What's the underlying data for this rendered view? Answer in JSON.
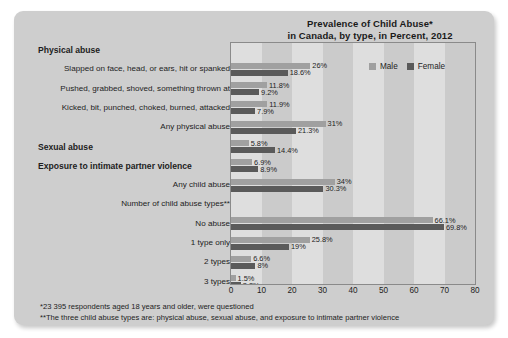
{
  "chart_data": {
    "type": "bar",
    "orientation": "horizontal",
    "title": "Prevalence of Child Abuse*\nin Canada, by type, in Percent, 2012",
    "title_lines": [
      "Prevalence of Child Abuse*",
      "in Canada, by type, in Percent, 2012"
    ],
    "xlabel": "",
    "ylabel": "",
    "xlim": [
      0,
      80
    ],
    "xticks": [
      0,
      10,
      20,
      30,
      40,
      50,
      60,
      70,
      80
    ],
    "xtick_labels": [
      "0",
      "10",
      "20",
      "30",
      "40",
      "50",
      "60",
      "70",
      "80"
    ],
    "grid": false,
    "background_banding": true,
    "legend_position": "top-right",
    "legend": [
      {
        "name": "Male",
        "color": "#a0a0a0"
      },
      {
        "name": "Female",
        "color": "#5a5a5a"
      }
    ],
    "series": [
      {
        "name": "Male",
        "color": "#a0a0a0",
        "values": [
          26,
          11.8,
          11.9,
          31,
          5.8,
          6.9,
          34,
          null,
          66.1,
          25.8,
          6.6,
          1.5
        ]
      },
      {
        "name": "Female",
        "color": "#5a5a5a",
        "values": [
          18.6,
          9.2,
          7.9,
          21.3,
          14.4,
          8.9,
          30.3,
          null,
          69.8,
          19,
          8,
          3.2
        ]
      }
    ],
    "categories": [
      "Slapped on face, head, or ears, hit or spanked",
      "Pushed, grabbed, shoved, something thrown at",
      "Kicked, bit, punched, choked, burned, attacked",
      "Any physical abuse",
      "Sexual abuse",
      "Exposure to intimate partner violence",
      "Any child abuse",
      "Number of child abuse types**",
      "No abuse",
      "1 type only",
      "2 types",
      "3 types"
    ],
    "value_labels": {
      "male": [
        "26%",
        "11.8%",
        "11.9%",
        "31%",
        "5.8%",
        "6.9%",
        "34%",
        "",
        "66.1%",
        "25.8%",
        "6.6%",
        "1.5%"
      ],
      "female": [
        "18.6%",
        "9.2%",
        "7.9%",
        "21.3%",
        "14.4%",
        "8.9%",
        "30.3%",
        "",
        "69.8%",
        "19%",
        "8%",
        "3.2%"
      ]
    },
    "rows": [
      {
        "label": "Physical abuse",
        "kind": "heading",
        "male": null,
        "female": null,
        "male_label": "",
        "female_label": ""
      },
      {
        "label": "Slapped on face, head, or ears, hit or spanked",
        "kind": "item",
        "male": 26,
        "female": 18.6,
        "male_label": "26%",
        "female_label": "18.6%"
      },
      {
        "label": "Pushed, grabbed, shoved, something thrown at",
        "kind": "item",
        "male": 11.8,
        "female": 9.2,
        "male_label": "11.8%",
        "female_label": "9.2%"
      },
      {
        "label": "Kicked, bit, punched, choked, burned, attacked",
        "kind": "item",
        "male": 11.9,
        "female": 7.9,
        "male_label": "11.9%",
        "female_label": "7.9%"
      },
      {
        "label": "Any physical abuse",
        "kind": "item",
        "male": 31,
        "female": 21.3,
        "male_label": "31%",
        "female_label": "21.3%"
      },
      {
        "label": "Sexual abuse",
        "kind": "heading",
        "male": 5.8,
        "female": 14.4,
        "male_label": "5.8%",
        "female_label": "14.4%"
      },
      {
        "label": "Exposure to intimate partner violence",
        "kind": "heading",
        "male": 6.9,
        "female": 8.9,
        "male_label": "6.9%",
        "female_label": "8.9%"
      },
      {
        "label": "Any child abuse",
        "kind": "item",
        "male": 34,
        "female": 30.3,
        "male_label": "34%",
        "female_label": "30.3%"
      },
      {
        "label": "Number of child abuse types**",
        "kind": "item",
        "male": null,
        "female": null,
        "male_label": "",
        "female_label": ""
      },
      {
        "label": "No abuse",
        "kind": "item",
        "male": 66.1,
        "female": 69.8,
        "male_label": "66.1%",
        "female_label": "69.8%"
      },
      {
        "label": "1 type only",
        "kind": "item",
        "male": 25.8,
        "female": 19,
        "male_label": "25.8%",
        "female_label": "19%"
      },
      {
        "label": "2 types",
        "kind": "item",
        "male": 6.6,
        "female": 8,
        "male_label": "6.6%",
        "female_label": "8%"
      },
      {
        "label": "3 types",
        "kind": "item",
        "male": 1.5,
        "female": 3.2,
        "male_label": "1.5%",
        "female_label": "3.2%"
      }
    ]
  },
  "footnotes": [
    "*23 395 respondents aged 18 years and older, were questioned",
    "**The three child abuse types are: physical abuse, sexual abuse, and exposure to intimate partner violence"
  ],
  "colors": {
    "male": "#a0a0a0",
    "female": "#5a5a5a",
    "card": "#cecece",
    "plot_background": "#dedede",
    "plot_band": "#cbcbcb",
    "text": "#1d1d1d"
  }
}
